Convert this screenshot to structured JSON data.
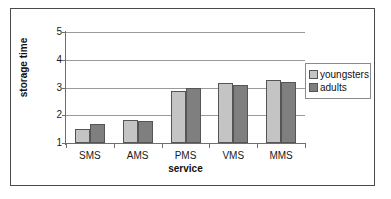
{
  "chart_data": {
    "type": "bar",
    "title": "",
    "xlabel": "service",
    "ylabel": "storage time",
    "categories": [
      "SMS",
      "AMS",
      "PMS",
      "VMS",
      "MMS"
    ],
    "series": [
      {
        "name": "youngsters",
        "color": "#c4c4c4",
        "values": [
          1.5,
          1.83,
          2.87,
          3.15,
          3.28
        ]
      },
      {
        "name": "adults",
        "color": "#7f7f7f",
        "values": [
          1.7,
          1.78,
          3.0,
          3.1,
          3.21
        ]
      }
    ],
    "ylim": [
      1,
      5
    ],
    "yticks": [
      "1",
      "2",
      "3",
      "4",
      "5"
    ],
    "grid": true,
    "legend_position": "right"
  },
  "legend": {
    "items": [
      {
        "label": "youngsters",
        "swatch": "legend-swatch-youngsters"
      },
      {
        "label": "adults",
        "swatch": "legend-swatch-adults"
      }
    ]
  }
}
